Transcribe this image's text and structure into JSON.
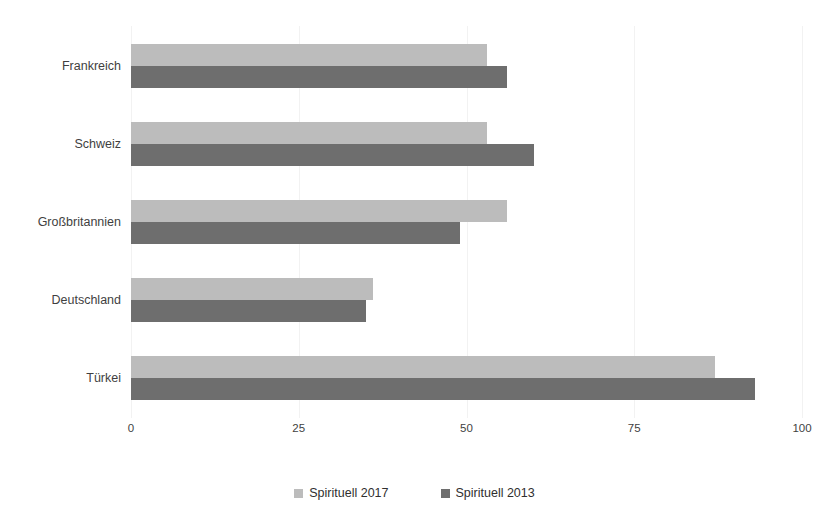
{
  "chart_data": {
    "type": "bar",
    "orientation": "horizontal",
    "title": "",
    "xlabel": "",
    "ylabel": "",
    "categories": [
      "Frankreich",
      "Schweiz",
      "Großbritannien",
      "Deutschland",
      "Türkei"
    ],
    "series": [
      {
        "name": "Spirituell 2017",
        "color": "#bcbcbc",
        "values": [
          53,
          53,
          56,
          36,
          87
        ]
      },
      {
        "name": "Spirituell 2013",
        "color": "#6e6e6e",
        "values": [
          56,
          60,
          49,
          35,
          93
        ]
      }
    ],
    "xlim": [
      0,
      100
    ],
    "xticks": [
      0,
      25,
      50,
      75,
      100
    ],
    "xtick_labels": [
      "0",
      "25",
      "50",
      "75",
      "100"
    ],
    "grid": true,
    "grid_axis": "x",
    "legend_position": "bottom-center"
  },
  "axis": {
    "tick_labels": [
      "0",
      "25",
      "50",
      "75",
      "100"
    ]
  },
  "legend": {
    "entries": [
      {
        "label": "Spirituell 2017",
        "color": "#bcbcbc"
      },
      {
        "label": "Spirituell 2013",
        "color": "#6e6e6e"
      }
    ]
  },
  "title_remnant": ""
}
